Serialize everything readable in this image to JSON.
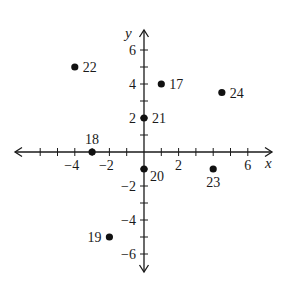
{
  "chart_data": {
    "type": "scatter",
    "title": "",
    "xlabel": "x",
    "ylabel": "y",
    "xlim": [
      -7,
      7
    ],
    "ylim": [
      -7,
      7
    ],
    "grid": false,
    "legend": null,
    "x_ticks": [
      -6,
      -5,
      -4,
      -3,
      -2,
      -1,
      1,
      2,
      3,
      4,
      5,
      6
    ],
    "y_ticks": [
      -6,
      -5,
      -4,
      -3,
      -2,
      -1,
      1,
      2,
      3,
      4,
      5,
      6
    ],
    "x_tick_labels": [
      {
        "value": -4,
        "label": "−4"
      },
      {
        "value": -2,
        "label": "−2"
      },
      {
        "value": 2,
        "label": "2"
      },
      {
        "value": 6,
        "label": "6"
      }
    ],
    "y_tick_labels": [
      {
        "value": 6,
        "label": "6"
      },
      {
        "value": 4,
        "label": "4"
      },
      {
        "value": 2,
        "label": "2"
      },
      {
        "value": -2,
        "label": "−2"
      },
      {
        "value": -4,
        "label": "−4"
      },
      {
        "value": -6,
        "label": "−6"
      }
    ],
    "points": [
      {
        "label": "17",
        "x": 1,
        "y": 4,
        "label_pos": "right"
      },
      {
        "label": "18",
        "x": -3,
        "y": 0,
        "label_pos": "above"
      },
      {
        "label": "19",
        "x": -2,
        "y": -5,
        "label_pos": "left"
      },
      {
        "label": "20",
        "x": 0,
        "y": -1,
        "label_pos": "below-right"
      },
      {
        "label": "21",
        "x": 0,
        "y": 2,
        "label_pos": "right"
      },
      {
        "label": "22",
        "x": -4,
        "y": 5,
        "label_pos": "right"
      },
      {
        "label": "23",
        "x": 4,
        "y": -1,
        "label_pos": "below"
      },
      {
        "label": "24",
        "x": 4.5,
        "y": 3.5,
        "label_pos": "right"
      }
    ]
  },
  "style": {
    "axis_color": "#1a1a1a",
    "point_color": "#111111",
    "background": "#ffffff"
  }
}
